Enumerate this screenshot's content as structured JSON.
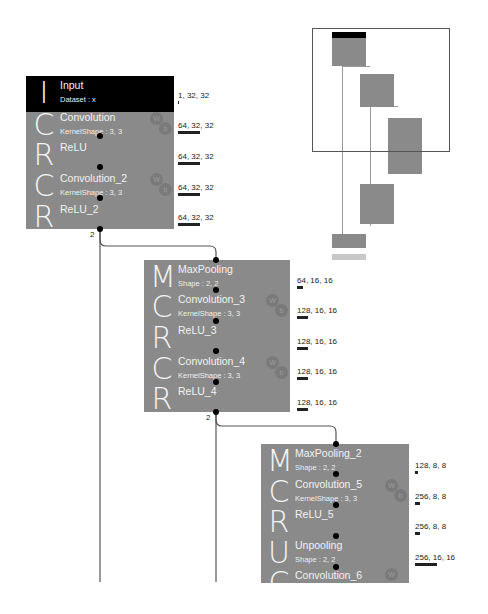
{
  "colors": {
    "block_bg": "#8a8a8a",
    "input_bg": "#000000",
    "text_on_block": "#f2f2f2",
    "wire": "#555555",
    "dot": "#000000"
  },
  "blocks": [
    {
      "id": "block1",
      "layers": [
        {
          "letter": "I",
          "name": "Input",
          "param": "Dataset : x",
          "shape": "1, 32, 32",
          "bar_width": 1,
          "weights": false
        },
        {
          "letter": "C",
          "name": "Convolution",
          "param": "KernelShape : 3, 3",
          "shape": "64, 32, 32",
          "bar_width": 22,
          "weights": true
        },
        {
          "letter": "R",
          "name": "ReLU",
          "param": "",
          "shape": "64, 32, 32",
          "bar_width": 22,
          "weights": false
        },
        {
          "letter": "C",
          "name": "Convolution_2",
          "param": "KernelShape : 3, 3",
          "shape": "64, 32, 32",
          "bar_width": 22,
          "weights": true
        },
        {
          "letter": "R",
          "name": "ReLU_2",
          "param": "",
          "shape": "64, 32, 32",
          "bar_width": 22,
          "weights": false
        }
      ],
      "output_count": "2"
    },
    {
      "id": "block2",
      "layers": [
        {
          "letter": "M",
          "name": "MaxPooling",
          "param": "Shape : 2, 2",
          "shape": "64, 16, 16",
          "bar_width": 6,
          "weights": false
        },
        {
          "letter": "C",
          "name": "Convolution_3",
          "param": "KernelShape : 3, 3",
          "shape": "128, 16, 16",
          "bar_width": 11,
          "weights": true
        },
        {
          "letter": "R",
          "name": "ReLU_3",
          "param": "",
          "shape": "128, 16, 16",
          "bar_width": 11,
          "weights": false
        },
        {
          "letter": "C",
          "name": "Convolution_4",
          "param": "KernelShape : 3, 3",
          "shape": "128, 16, 16",
          "bar_width": 11,
          "weights": true
        },
        {
          "letter": "R",
          "name": "ReLU_4",
          "param": "",
          "shape": "128, 16, 16",
          "bar_width": 11,
          "weights": false
        }
      ],
      "output_count": "2"
    },
    {
      "id": "block3",
      "layers": [
        {
          "letter": "M",
          "name": "MaxPooling_2",
          "param": "Shape : 2, 2",
          "shape": "128, 8, 8",
          "bar_width": 3,
          "weights": false
        },
        {
          "letter": "C",
          "name": "Convolution_5",
          "param": "KernelShape : 3, 3",
          "shape": "256, 8, 8",
          "bar_width": 5,
          "weights": true
        },
        {
          "letter": "R",
          "name": "ReLU_5",
          "param": "",
          "shape": "256, 8, 8",
          "bar_width": 5,
          "weights": false
        },
        {
          "letter": "U",
          "name": "Unpooling",
          "param": "Shape : 2, 2",
          "shape": "256, 16, 16",
          "bar_width": 22,
          "weights": false
        },
        {
          "letter": "C",
          "name": "Convolution_6",
          "param": "",
          "shape": "",
          "bar_width": 0,
          "weights": true
        }
      ]
    }
  ],
  "badges": {
    "w": "W",
    "b": "b"
  },
  "minimap": {
    "label": "network-overview"
  }
}
